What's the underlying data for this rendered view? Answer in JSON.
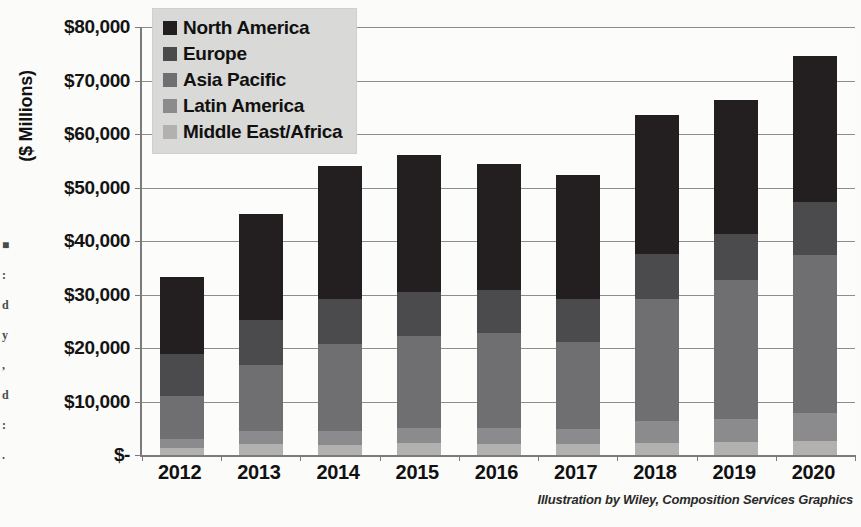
{
  "chart_data": {
    "type": "bar",
    "stacked": true,
    "title": "",
    "subtitle": "",
    "xlabel": "",
    "ylabel": "($ Millions)",
    "grid": true,
    "legend_position": "top-left",
    "categories": [
      "2012",
      "2013",
      "2014",
      "2015",
      "2016",
      "2017",
      "2018",
      "2019",
      "2020"
    ],
    "ylim": [
      0,
      80000
    ],
    "ytick_values": [
      0,
      10000,
      20000,
      30000,
      40000,
      50000,
      60000,
      70000,
      80000
    ],
    "ytick_labels": [
      "$-",
      "$10,000",
      "$20,000",
      "$30,000",
      "$40,000",
      "$50,000",
      "$60,000",
      "$70,000",
      "$80,000"
    ],
    "series": [
      {
        "name": "North America",
        "color": "#231f20",
        "values": [
          14300,
          19800,
          25000,
          25600,
          23500,
          23300,
          26100,
          25000,
          27200
        ]
      },
      {
        "name": "Europe",
        "color": "#4b4a4c",
        "values": [
          7900,
          8500,
          8400,
          8200,
          8000,
          7900,
          8300,
          8500,
          9900
        ]
      },
      {
        "name": "Asia Pacific",
        "color": "#6f6e70",
        "values": [
          8000,
          12300,
          16200,
          17300,
          17900,
          16300,
          22900,
          26000,
          29600
        ]
      },
      {
        "name": "Latin America",
        "color": "#8b8a8c",
        "values": [
          1700,
          2500,
          2700,
          2800,
          3000,
          2900,
          4000,
          4300,
          5100
        ]
      },
      {
        "name": "Middle East/Africa",
        "color": "#b2b1b0",
        "values": [
          1300,
          2000,
          1800,
          2200,
          2000,
          2000,
          2300,
          2500,
          2700
        ]
      }
    ],
    "totals": [
      33200,
      45100,
      54100,
      56100,
      54400,
      52400,
      63600,
      66300,
      74500
    ]
  },
  "legend": {
    "items": [
      {
        "label": "North America",
        "color": "#231f20"
      },
      {
        "label": "Europe",
        "color": "#4b4a4c"
      },
      {
        "label": "Asia Pacific",
        "color": "#6f6e70"
      },
      {
        "label": "Latin America",
        "color": "#8b8a8c"
      },
      {
        "label": "Middle East/Africa",
        "color": "#b2b1b0"
      }
    ]
  },
  "credit": "Illustration by Wiley, Composition Services Graphics",
  "edge_artifacts": [
    "■",
    ":",
    "d",
    "y",
    ",",
    "d",
    ":",
    "."
  ],
  "colors": {
    "plot_background": "#fcfcfa",
    "page_background": "#fbfbf9",
    "axis_line": "#7b7b7b",
    "gridline": "#8d8d8d",
    "legend_background": "#d9d9d7",
    "text": "#111111"
  }
}
